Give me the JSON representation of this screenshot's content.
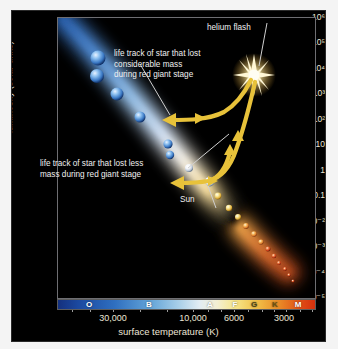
{
  "figure": {
    "title_alt": "Hertzsprung-Russell diagram of stellar life tracks"
  },
  "axes": {
    "y_title": "luminosity (solar units)",
    "x_title": "surface temperature (K)",
    "y_ticks": [
      "10⁶",
      "10⁵",
      "10⁴",
      "10³",
      "10²",
      "10",
      "1",
      "0.1",
      "10⁻²",
      "10⁻³",
      "10⁻⁴",
      "10⁻⁵"
    ],
    "x_ticks": [
      "30,000",
      "10,000",
      "6000",
      "3000"
    ]
  },
  "spectral_classes": [
    {
      "label": "O",
      "color": "#ffffff"
    },
    {
      "label": "B",
      "color": "#ffffff"
    },
    {
      "label": "A",
      "color": "#ffffff"
    },
    {
      "label": "F",
      "color": "#ffffff"
    },
    {
      "label": "G",
      "color": "#4a4418"
    },
    {
      "label": "K",
      "color": "#6a5210"
    },
    {
      "label": "M",
      "color": "#ffffff"
    }
  ],
  "annotations": {
    "helium_flash": "helium flash",
    "considerable_mass_l1": "life track of star that lost",
    "considerable_mass_l2": "considerable mass",
    "considerable_mass_l3": "during red giant stage",
    "less_mass_l1": "life track of star that lost less",
    "less_mass_l2": "mass during red giant stage",
    "sun": "Sun"
  },
  "colors": {
    "panel_background": "#000000",
    "page_background": "#f4f4f4",
    "text": "#f0f0f0",
    "tick_text": "#ece5d6",
    "track": "#e8c23a",
    "frame": "#6e6e72"
  },
  "chart_data": {
    "type": "scatter",
    "xlabel": "surface temperature (K)",
    "ylabel": "luminosity (solar units)",
    "x_scale": "log-reversed",
    "y_scale": "log",
    "xlim": [
      40000,
      2300
    ],
    "ylim": [
      1e-05,
      1000000.0
    ],
    "grid": false,
    "legend": "none",
    "x_tick_values": [
      30000,
      10000,
      6000,
      3000
    ],
    "y_tick_values": [
      1000000,
      100000,
      10000,
      1000,
      100,
      10,
      1,
      0.1,
      0.01,
      0.001,
      0.0001,
      1e-05
    ],
    "series": [
      {
        "name": "main sequence stars (blue, upper-left)",
        "color": "#7fb4e8",
        "points": [
          {
            "x": 30000,
            "y": 100000
          },
          {
            "x": 29000,
            "y": 30000
          },
          {
            "x": 22000,
            "y": 10000
          },
          {
            "x": 16000,
            "y": 800
          },
          {
            "x": 11000,
            "y": 50
          },
          {
            "x": 10500,
            "y": 22
          },
          {
            "x": 9000,
            "y": 8
          }
        ]
      },
      {
        "name": "main sequence stars (yellow-red, lower-right)",
        "color": "#f2c24a",
        "points": [
          {
            "x": 6100,
            "y": 1.4
          },
          {
            "x": 5800,
            "y": 1.0
          },
          {
            "x": 5300,
            "y": 0.55
          },
          {
            "x": 4900,
            "y": 0.3
          },
          {
            "x": 4500,
            "y": 0.14
          },
          {
            "x": 4200,
            "y": 0.07
          },
          {
            "x": 3900,
            "y": 0.03
          },
          {
            "x": 3700,
            "y": 0.012
          },
          {
            "x": 3500,
            "y": 0.005
          },
          {
            "x": 3300,
            "y": 0.0018
          },
          {
            "x": 3100,
            "y": 0.0006
          },
          {
            "x": 2900,
            "y": 0.0003
          }
        ]
      },
      {
        "name": "Sun",
        "color": "#ffffff",
        "points": [
          {
            "x": 5800,
            "y": 1
          }
        ]
      },
      {
        "name": "helium flash",
        "color": "#ffd966",
        "points": [
          {
            "x": 3900,
            "y": 2000
          }
        ]
      }
    ],
    "tracks": [
      {
        "name": "life track of star that lost considerable mass during red giant stage",
        "color": "#e8c23a",
        "points": [
          {
            "x": 3900,
            "y": 2000
          },
          {
            "x": 4600,
            "y": 300
          },
          {
            "x": 7000,
            "y": 150
          },
          {
            "x": 12000,
            "y": 130
          }
        ]
      },
      {
        "name": "life track of star that lost less mass during red giant stage",
        "color": "#e8c23a",
        "points": [
          {
            "x": 3900,
            "y": 2000
          },
          {
            "x": 3800,
            "y": 60
          },
          {
            "x": 4100,
            "y": 9
          },
          {
            "x": 5200,
            "y": 7
          },
          {
            "x": 7500,
            "y": 7
          }
        ]
      }
    ]
  }
}
